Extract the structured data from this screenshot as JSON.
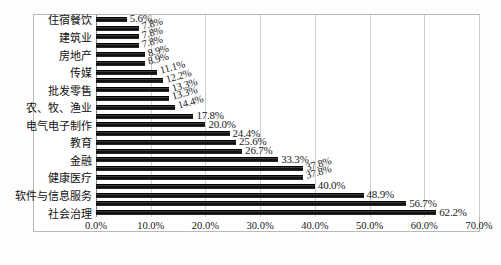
{
  "chart_data": {
    "type": "bar",
    "orientation": "horizontal",
    "title": "",
    "xlabel": "",
    "ylabel": "",
    "xlim": [
      0,
      70
    ],
    "xticks": [
      "0.0%",
      "10.0%",
      "20.0%",
      "30.0%",
      "40.0%",
      "50.0%",
      "60.0%",
      "70.0%"
    ],
    "xtick_values": [
      0,
      10,
      20,
      30,
      40,
      50,
      60,
      70
    ],
    "grid": true,
    "grid_axis": "x",
    "legend": null,
    "bar_color": "#121212",
    "categories": [
      "住宿餐饮",
      "",
      "建筑业",
      "",
      "房地产",
      "",
      "传媒",
      "",
      "批发零售",
      "",
      "农、牧、渔业",
      "",
      "电气电子制作",
      "",
      "教育",
      "",
      "金融",
      "",
      "健康医疗",
      "",
      "软件与信息服务",
      "",
      "社会治理"
    ],
    "values": [
      5.6,
      7.8,
      7.8,
      7.8,
      8.9,
      8.9,
      11.1,
      12.2,
      13.3,
      13.3,
      14.4,
      17.8,
      20.0,
      24.4,
      25.6,
      26.7,
      33.3,
      37.8,
      37.8,
      40.0,
      48.9,
      56.7,
      62.2
    ],
    "value_labels": [
      "5.6%",
      "7.8%",
      "7.8%",
      "7.8%",
      "8.9%",
      "8.9%",
      "11.1%",
      "12.2%",
      "13.3%",
      "13.3%",
      "14.4%",
      "17.8%",
      "20.0%",
      "24.4%",
      "25.6%",
      "26.7%",
      "33.3%",
      "37.8%",
      "37.8%",
      "40.0%",
      "48.9%",
      "56.7%",
      "62.2%"
    ],
    "visible_category_labels": [
      {
        "index": 0,
        "label": "住宿餐饮"
      },
      {
        "index": 2,
        "label": "建筑业"
      },
      {
        "index": 4,
        "label": "房地产"
      },
      {
        "index": 6,
        "label": "传媒"
      },
      {
        "index": 8,
        "label": "批发零售"
      },
      {
        "index": 10,
        "label": "农、牧、渔业"
      },
      {
        "index": 12,
        "label": "电气电子制作"
      },
      {
        "index": 14,
        "label": "教育"
      },
      {
        "index": 16,
        "label": "金融"
      },
      {
        "index": 18,
        "label": "健康医疗"
      },
      {
        "index": 20,
        "label": "软件与信息服务"
      },
      {
        "index": 22,
        "label": "社会治理"
      }
    ]
  }
}
